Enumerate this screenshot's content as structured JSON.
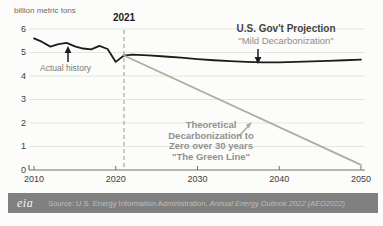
{
  "chart": {
    "unit_label": "billion metric tons"
  },
  "annotations": {
    "year_marker": "2021",
    "actual_history": "Actual history",
    "projection_title": "U.S. Gov't Projection",
    "projection_subtitle": "\"Mild Decarbonization\"",
    "theoretical_line1": "Theoretical",
    "theoretical_line2": "Decarbonization to",
    "theoretical_line3": "Zero over 30 years",
    "theoretical_line4": "\"The Green Line\""
  },
  "footer": {
    "logo_text": "eia",
    "source_prefix": "Source: U.S. Energy Information Administration, ",
    "source_publication": "Annual Energy Outlook 2022 (AEO2022)"
  },
  "colors": {
    "history_line": "#1c1c1c",
    "projection_line": "#1c1c1c",
    "green_line": "#a5b29b",
    "grid": "#e5e5e1",
    "axis": "#6f6f6f",
    "marker_dash": "#a6a6a6",
    "footer_bg": "#808080",
    "footer_text": "#bdbdbd"
  },
  "chart_data": {
    "type": "line",
    "title": "",
    "xlabel": "",
    "ylabel": "billion metric tons",
    "xlim": [
      2010,
      2050
    ],
    "ylim": [
      0,
      6
    ],
    "x_ticks": [
      2010,
      2020,
      2030,
      2040,
      2050
    ],
    "y_ticks": [
      0,
      1,
      2,
      3,
      4,
      5,
      6
    ],
    "grid": "horizontal-light",
    "legend": "annotated-inline",
    "marker_year": 2021,
    "series": [
      {
        "key": "actual-history",
        "name": "Actual history",
        "color": "#1c1c1c",
        "x": [
          2010,
          2011,
          2012,
          2013,
          2014,
          2015,
          2016,
          2017,
          2018,
          2019,
          2020,
          2021
        ],
        "values": [
          5.6,
          5.45,
          5.25,
          5.36,
          5.41,
          5.26,
          5.17,
          5.13,
          5.28,
          5.15,
          4.6,
          4.87
        ]
      },
      {
        "key": "govt-projection",
        "name": "U.S. Gov't Projection \"Mild Decarbonization\"",
        "color": "#1c1c1c",
        "x": [
          2021,
          2022,
          2024,
          2026,
          2028,
          2030,
          2032,
          2034,
          2036,
          2038,
          2040,
          2042,
          2044,
          2046,
          2048,
          2050
        ],
        "values": [
          4.87,
          4.91,
          4.88,
          4.83,
          4.78,
          4.72,
          4.67,
          4.63,
          4.6,
          4.58,
          4.58,
          4.6,
          4.62,
          4.64,
          4.67,
          4.7
        ]
      },
      {
        "key": "green-line",
        "name": "Theoretical Decarbonization to Zero over 30 years \"The Green Line\"",
        "color": "#a5b29b",
        "x": [
          2021,
          2050
        ],
        "values": [
          4.87,
          0.22
        ]
      }
    ]
  }
}
